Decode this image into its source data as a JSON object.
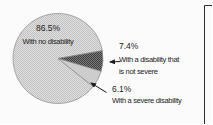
{
  "canvas": {
    "bg": "#fbfbfb"
  },
  "chart_data": {
    "type": "pie",
    "title": "",
    "slices": [
      {
        "pct_label": "86.5%",
        "label": "With no disability",
        "value": 86.5,
        "pattern": "stipple-light"
      },
      {
        "pct_label": "7.4%",
        "label": "With a disability that is not severe",
        "label_lines": [
          "With a disability that",
          "is not severe"
        ],
        "value": 7.4,
        "pattern": "crosshatch-dark"
      },
      {
        "pct_label": "6.1%",
        "label": "With a severe disability",
        "value": 6.1,
        "pattern": "solid-light"
      }
    ],
    "start_angle_deg": 38.6,
    "legend_position": "callouts",
    "colors": {
      "stipple_bg": "#dfdfdf",
      "stipple_dot": "#c2c2c2",
      "dark_bg": "#7c7c7c",
      "dark_dot": "#3c3c3c",
      "plain_slice": "#cdcdcd",
      "outline": "#8a8a8a",
      "arrow": "#1c1c1c",
      "text": "#1b1b1b",
      "panel_border": "#2e2e2e"
    }
  }
}
